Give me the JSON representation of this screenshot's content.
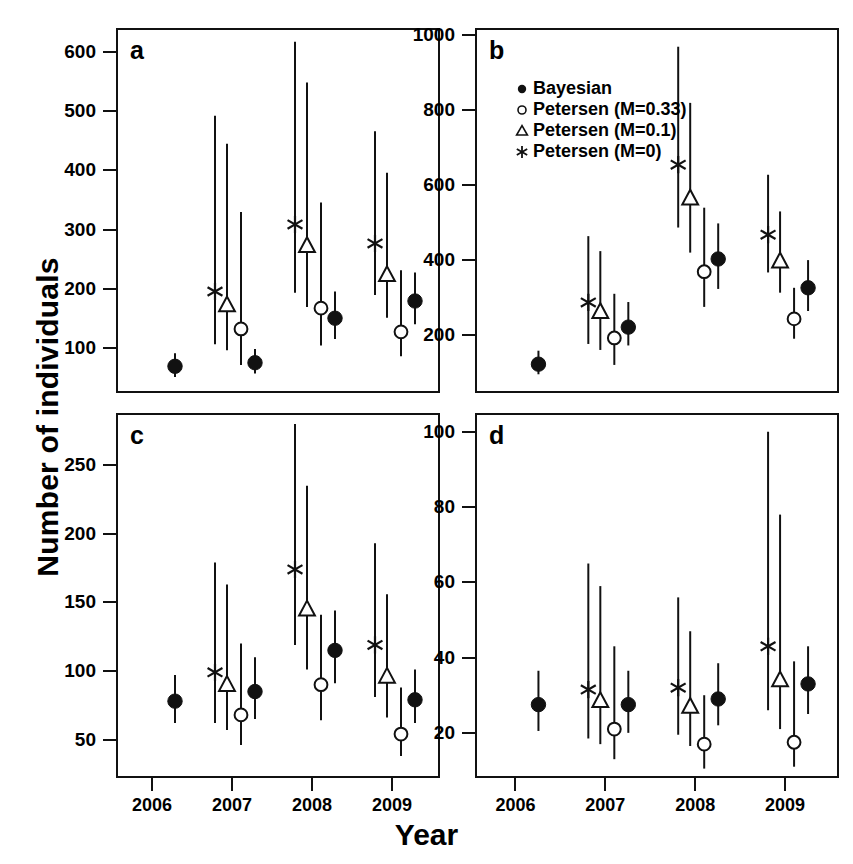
{
  "figure": {
    "ylabel": "Number of individuals",
    "xlabel": "Year"
  },
  "legend": {
    "position": "panel-b-top-left",
    "entries": [
      {
        "symbol": "filled-circle",
        "label": "Bayesian"
      },
      {
        "symbol": "open-circle",
        "label": "Petersen (M=0.33)"
      },
      {
        "symbol": "open-triangle",
        "label": "Petersen (M=0.1)"
      },
      {
        "symbol": "asterisk",
        "label": "Petersen (M=0)"
      }
    ]
  },
  "chart_data": [
    {
      "id": "a",
      "panel_label": "a",
      "type": "scatter",
      "title": "",
      "xlabel": "Year",
      "ylabel": "Number of individuals",
      "grid": false,
      "x": [
        2006,
        2007,
        2008,
        2009
      ],
      "xlim": [
        2005.55,
        2009.6
      ],
      "xticks": [
        2006,
        2007,
        2008,
        2009
      ],
      "xticklabels": [
        "2006",
        "2007",
        "2008",
        "2009"
      ],
      "ylim": [
        25,
        640
      ],
      "yticks": [
        100,
        200,
        300,
        400,
        500,
        600
      ],
      "yticklabels": [
        "100",
        "200",
        "300",
        "400",
        "500",
        "600"
      ],
      "series": [
        {
          "name": "Petersen (M=0)",
          "symbol": "asterisk",
          "points": [
            {
              "year": 2007,
              "value": 196,
              "low": 107,
              "high": 492
            },
            {
              "year": 2008,
              "value": 309,
              "low": 194,
              "high": 617
            },
            {
              "year": 2009,
              "value": 277,
              "low": 190,
              "high": 466
            }
          ]
        },
        {
          "name": "Petersen (M=0.1)",
          "symbol": "open-triangle",
          "points": [
            {
              "year": 2007,
              "value": 173,
              "low": 97,
              "high": 445
            },
            {
              "year": 2008,
              "value": 273,
              "low": 170,
              "high": 548
            },
            {
              "year": 2009,
              "value": 224,
              "low": 152,
              "high": 396
            }
          ]
        },
        {
          "name": "Petersen (M=0.33)",
          "symbol": "open-circle",
          "points": [
            {
              "year": 2007,
              "value": 133,
              "low": 72,
              "high": 330
            },
            {
              "year": 2008,
              "value": 168,
              "low": 105,
              "high": 346
            },
            {
              "year": 2009,
              "value": 128,
              "low": 87,
              "high": 232
            }
          ]
        },
        {
          "name": "Bayesian",
          "symbol": "filled-circle",
          "points": [
            {
              "year": 2006,
              "value": 70,
              "low": 52,
              "high": 92
            },
            {
              "year": 2007,
              "value": 76,
              "low": 58,
              "high": 99
            },
            {
              "year": 2008,
              "value": 151,
              "low": 116,
              "high": 196
            },
            {
              "year": 2009,
              "value": 180,
              "low": 141,
              "high": 228
            }
          ]
        }
      ]
    },
    {
      "id": "b",
      "panel_label": "b",
      "type": "scatter",
      "title": "",
      "xlabel": "Year",
      "ylabel": "Number of individuals",
      "grid": false,
      "x": [
        2006,
        2007,
        2008,
        2009
      ],
      "xlim": [
        2005.55,
        2009.6
      ],
      "xticks": [
        2006,
        2007,
        2008,
        2009
      ],
      "xticklabels": [
        "2006",
        "2007",
        "2008",
        "2009"
      ],
      "ylim": [
        45,
        1020
      ],
      "yticks": [
        200,
        400,
        600,
        800,
        1000
      ],
      "yticklabels": [
        "200",
        "400",
        "600",
        "800",
        "1000"
      ],
      "series": [
        {
          "name": "Petersen (M=0)",
          "symbol": "asterisk",
          "points": [
            {
              "year": 2007,
              "value": 287,
              "low": 176,
              "high": 464
            },
            {
              "year": 2008,
              "value": 655,
              "low": 487,
              "high": 970
            },
            {
              "year": 2009,
              "value": 468,
              "low": 367,
              "high": 628
            }
          ]
        },
        {
          "name": "Petersen (M=0.1)",
          "symbol": "open-triangle",
          "points": [
            {
              "year": 2007,
              "value": 262,
              "low": 160,
              "high": 424
            },
            {
              "year": 2008,
              "value": 565,
              "low": 420,
              "high": 820
            },
            {
              "year": 2009,
              "value": 397,
              "low": 313,
              "high": 530
            }
          ]
        },
        {
          "name": "Petersen (M=0.33)",
          "symbol": "open-circle",
          "points": [
            {
              "year": 2007,
              "value": 192,
              "low": 120,
              "high": 310
            },
            {
              "year": 2008,
              "value": 369,
              "low": 275,
              "high": 540
            },
            {
              "year": 2009,
              "value": 243,
              "low": 190,
              "high": 326
            }
          ]
        },
        {
          "name": "Bayesian",
          "symbol": "filled-circle",
          "points": [
            {
              "year": 2006,
              "value": 122,
              "low": 95,
              "high": 158
            },
            {
              "year": 2007,
              "value": 221,
              "low": 172,
              "high": 288
            },
            {
              "year": 2008,
              "value": 403,
              "low": 323,
              "high": 498
            },
            {
              "year": 2009,
              "value": 326,
              "low": 264,
              "high": 400
            }
          ]
        }
      ]
    },
    {
      "id": "c",
      "panel_label": "c",
      "type": "scatter",
      "title": "",
      "xlabel": "Year",
      "ylabel": "Number of individuals",
      "grid": false,
      "x": [
        2006,
        2007,
        2008,
        2009
      ],
      "xlim": [
        2005.55,
        2009.6
      ],
      "xticks": [
        2006,
        2007,
        2008,
        2009
      ],
      "xticklabels": [
        "2006",
        "2007",
        "2008",
        "2009"
      ],
      "ylim": [
        22,
        288
      ],
      "yticks": [
        50,
        100,
        150,
        200,
        250
      ],
      "yticklabels": [
        "50",
        "100",
        "150",
        "200",
        "250"
      ],
      "series": [
        {
          "name": "Petersen (M=0)",
          "symbol": "asterisk",
          "points": [
            {
              "year": 2007,
              "value": 99,
              "low": 62,
              "high": 179
            },
            {
              "year": 2008,
              "value": 174,
              "low": 119,
              "high": 280
            },
            {
              "year": 2009,
              "value": 119,
              "low": 81,
              "high": 193
            }
          ]
        },
        {
          "name": "Petersen (M=0.1)",
          "symbol": "open-triangle",
          "points": [
            {
              "year": 2007,
              "value": 90,
              "low": 57,
              "high": 163
            },
            {
              "year": 2008,
              "value": 145,
              "low": 101,
              "high": 235
            },
            {
              "year": 2009,
              "value": 96,
              "low": 66,
              "high": 156
            }
          ]
        },
        {
          "name": "Petersen (M=0.33)",
          "symbol": "open-circle",
          "points": [
            {
              "year": 2007,
              "value": 68,
              "low": 46,
              "high": 120
            },
            {
              "year": 2008,
              "value": 90,
              "low": 64,
              "high": 141
            },
            {
              "year": 2009,
              "value": 54,
              "low": 38,
              "high": 88
            }
          ]
        },
        {
          "name": "Bayesian",
          "symbol": "filled-circle",
          "points": [
            {
              "year": 2006,
              "value": 78,
              "low": 62,
              "high": 97
            },
            {
              "year": 2007,
              "value": 85,
              "low": 65,
              "high": 110
            },
            {
              "year": 2008,
              "value": 115,
              "low": 91,
              "high": 144
            },
            {
              "year": 2009,
              "value": 79,
              "low": 62,
              "high": 101
            }
          ]
        }
      ]
    },
    {
      "id": "d",
      "panel_label": "d",
      "type": "scatter",
      "title": "",
      "xlabel": "Year",
      "ylabel": "Number of individuals",
      "grid": false,
      "x": [
        2006,
        2007,
        2008,
        2009
      ],
      "xlim": [
        2005.55,
        2009.6
      ],
      "xticks": [
        2006,
        2007,
        2008,
        2009
      ],
      "xticklabels": [
        "2006",
        "2007",
        "2008",
        "2009"
      ],
      "ylim": [
        8,
        105
      ],
      "yticks": [
        20,
        40,
        60,
        80,
        100
      ],
      "yticklabels": [
        "20",
        "40",
        "60",
        "80",
        "100"
      ],
      "series": [
        {
          "name": "Petersen (M=0)",
          "symbol": "asterisk",
          "points": [
            {
              "year": 2007,
              "value": 31.5,
              "low": 18.5,
              "high": 65
            },
            {
              "year": 2008,
              "value": 32,
              "low": 19.5,
              "high": 56
            },
            {
              "year": 2009,
              "value": 43,
              "low": 26,
              "high": 100
            }
          ]
        },
        {
          "name": "Petersen (M=0.1)",
          "symbol": "open-triangle",
          "points": [
            {
              "year": 2007,
              "value": 28.5,
              "low": 17,
              "high": 59
            },
            {
              "year": 2008,
              "value": 27,
              "low": 16.5,
              "high": 47
            },
            {
              "year": 2009,
              "value": 34,
              "low": 21,
              "high": 78
            }
          ]
        },
        {
          "name": "Petersen (M=0.33)",
          "symbol": "open-circle",
          "points": [
            {
              "year": 2007,
              "value": 21,
              "low": 13,
              "high": 43
            },
            {
              "year": 2008,
              "value": 17,
              "low": 10.5,
              "high": 30
            },
            {
              "year": 2009,
              "value": 17.5,
              "low": 11,
              "high": 39
            }
          ]
        },
        {
          "name": "Bayesian",
          "symbol": "filled-circle",
          "points": [
            {
              "year": 2006,
              "value": 27.5,
              "low": 20.5,
              "high": 36.5
            },
            {
              "year": 2007,
              "value": 27.5,
              "low": 20,
              "high": 36.5
            },
            {
              "year": 2008,
              "value": 29,
              "low": 22,
              "high": 38.5
            },
            {
              "year": 2009,
              "value": 33,
              "low": 25,
              "high": 43
            }
          ]
        }
      ]
    }
  ]
}
